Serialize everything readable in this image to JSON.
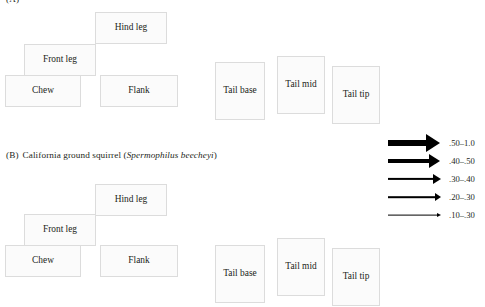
{
  "figure": {
    "width": 485,
    "height": 307,
    "background": "#ffffff",
    "box_fill": "#fbfbfb",
    "box_border": "#dcdcdc",
    "text_color": "#231f20",
    "arrow_color": "#000000"
  },
  "panels": [
    {
      "id": "A",
      "label": "(A)",
      "caption_clipped": true,
      "nodes": [
        {
          "name": "hind-leg",
          "label": "Hind leg",
          "x": 95,
          "y": 12,
          "w": 72,
          "h": 32
        },
        {
          "name": "front-leg",
          "label": "Front leg",
          "x": 24,
          "y": 44,
          "w": 72,
          "h": 32
        },
        {
          "name": "chew",
          "label": "Chew",
          "x": 5,
          "y": 75,
          "w": 76,
          "h": 32
        },
        {
          "name": "flank",
          "label": "Flank",
          "x": 100,
          "y": 75,
          "w": 78,
          "h": 32
        },
        {
          "name": "tail-base",
          "label": "Tail base",
          "x": 215,
          "y": 62,
          "w": 50,
          "h": 58
        },
        {
          "name": "tail-mid",
          "label": "Tail mid",
          "x": 277,
          "y": 56,
          "w": 48,
          "h": 58
        },
        {
          "name": "tail-tip",
          "label": "Tail tip",
          "x": 332,
          "y": 66,
          "w": 48,
          "h": 58
        }
      ]
    },
    {
      "id": "B",
      "label": "(B)",
      "caption_text": "California ground squirrel (",
      "caption_species": "Spermophilus beecheyi",
      "caption_close": ")",
      "caption_x": 6,
      "caption_y": 150,
      "nodes": [
        {
          "name": "hind-leg",
          "label": "Hind leg",
          "x": 95,
          "y": 184,
          "w": 72,
          "h": 32
        },
        {
          "name": "front-leg",
          "label": "Front leg",
          "x": 24,
          "y": 214,
          "w": 72,
          "h": 32
        },
        {
          "name": "chew",
          "label": "Chew",
          "x": 5,
          "y": 245,
          "w": 76,
          "h": 32
        },
        {
          "name": "flank",
          "label": "Flank",
          "x": 100,
          "y": 245,
          "w": 78,
          "h": 32
        },
        {
          "name": "tail-base",
          "label": "Tail base",
          "x": 215,
          "y": 245,
          "w": 50,
          "h": 58
        },
        {
          "name": "tail-mid",
          "label": "Tail mid",
          "x": 277,
          "y": 238,
          "w": 48,
          "h": 58
        },
        {
          "name": "tail-tip",
          "label": "Tail tip",
          "x": 332,
          "y": 248,
          "w": 48,
          "h": 58
        }
      ]
    }
  ],
  "legend": {
    "title": "",
    "rows": [
      {
        "name": "legend-50-100",
        "label": ".50–1.0",
        "shaft_thickness": 6,
        "shaft_length": 40,
        "head_w": 14,
        "head_h": 9,
        "y": 0
      },
      {
        "name": "legend-40-50",
        "label": ".40–.50",
        "shaft_thickness": 4,
        "shaft_length": 43,
        "head_w": 11,
        "head_h": 7,
        "y": 18
      },
      {
        "name": "legend-30-40",
        "label": ".30–.40",
        "shaft_thickness": 2.2,
        "shaft_length": 47,
        "head_w": 8,
        "head_h": 5,
        "y": 36
      },
      {
        "name": "legend-20-30",
        "label": ".20–.30",
        "shaft_thickness": 1.6,
        "shaft_length": 49,
        "head_w": 6,
        "head_h": 4,
        "y": 54
      },
      {
        "name": "legend-10-30",
        "label": ".10–.30",
        "shaft_thickness": 0.8,
        "shaft_length": 51,
        "head_w": 4,
        "head_h": 2.6,
        "y": 72
      }
    ]
  }
}
